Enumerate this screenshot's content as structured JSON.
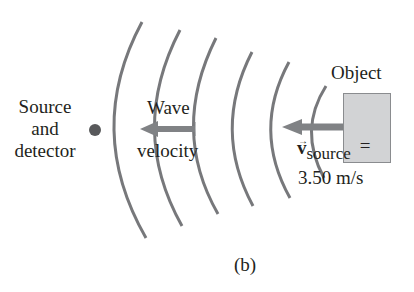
{
  "figure": {
    "label": "(b)",
    "source_label_lines": [
      "Source",
      "and",
      "detector"
    ],
    "wave_label_lines": [
      "Wave",
      "velocity"
    ],
    "object_label": "Object",
    "source_velocity": {
      "symbol": "v",
      "subscript": "source",
      "equals": "=",
      "value": "3.50 m/s"
    }
  },
  "colors": {
    "wave": "#77787b",
    "arrow": "#808285",
    "object_fill": "#d2d3d5",
    "dot": "#58595b",
    "text": "#231f20"
  }
}
